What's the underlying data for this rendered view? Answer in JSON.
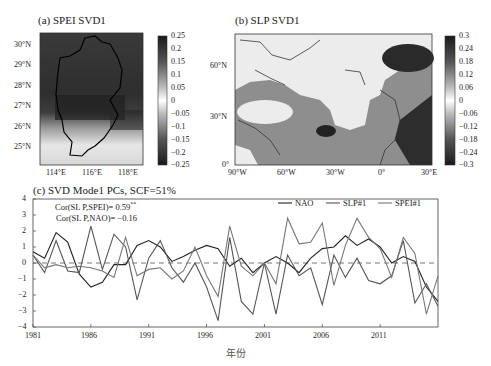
{
  "chart_data": [
    {
      "type": "heatmap",
      "title": "(a) SPEI SVD1",
      "xlabel": "",
      "ylabel": "",
      "x_ticks": [
        "114°E",
        "116°E",
        "118°E"
      ],
      "y_ticks": [
        "30°N",
        "29°N",
        "28°N",
        "27°N",
        "26°N",
        "25°N"
      ],
      "colorbar": {
        "ticks": [
          "0.25",
          "0.2",
          "0.15",
          "0.1",
          "0.05",
          "0",
          "−0.05",
          "−0.1",
          "−0.15",
          "−0.2",
          "−0.25"
        ],
        "range": [
          -0.25,
          0.25
        ],
        "colormap": "grayscale (dark = extreme, white = 0)"
      },
      "description": "Spatial pattern of leading SVD mode for SPEI over Jiangxi region; strong values (dark) across north/central, weak (light) in south"
    },
    {
      "type": "heatmap",
      "title": "(b) SLP SVD1",
      "xlabel": "",
      "ylabel": "",
      "x_ticks": [
        "90°W",
        "60°W",
        "30°W",
        "0°",
        "30°E"
      ],
      "y_ticks": [
        "60°N",
        "30°N",
        "0°"
      ],
      "colorbar": {
        "ticks": [
          "0.3",
          "0.24",
          "0.18",
          "0.12",
          "0.06",
          "0",
          "−0.06",
          "−0.12",
          "−0.18",
          "−0.24",
          "−0.3"
        ],
        "range": [
          -0.3,
          0.3
        ],
        "colormap": "grayscale (dark = extreme, white = 0)"
      },
      "description": "Spatial pattern of leading SVD mode for North Atlantic SLP; dark centers over Scandinavia/Europe-Africa and near 25°N 30°W"
    },
    {
      "type": "line",
      "title": "(c) SVD Mode1 PCs, SCF=51%",
      "xlabel": "年份",
      "ylabel": "",
      "ylim": [
        -4,
        4
      ],
      "xlim": [
        1981,
        2016
      ],
      "x_ticks": [
        "1981",
        "1986",
        "1991",
        "1996",
        "2001",
        "2006",
        "2011"
      ],
      "y_ticks": [
        "4",
        "3",
        "2",
        "1",
        "0",
        "−1",
        "−2",
        "−3",
        "−4"
      ],
      "grid": false,
      "zero_line": "dashed",
      "legend_position": "top-right",
      "annotations": [
        "Cor(SLP,SPEI)= 0.59**",
        "Cor(SLP,NAO)= −0.16"
      ],
      "x": [
        1981,
        1982,
        1983,
        1984,
        1985,
        1986,
        1987,
        1988,
        1989,
        1990,
        1991,
        1992,
        1993,
        1994,
        1995,
        1996,
        1997,
        1998,
        1999,
        2000,
        2001,
        2002,
        2003,
        2004,
        2005,
        2006,
        2007,
        2008,
        2009,
        2010,
        2011,
        2012,
        2013,
        2014,
        2015,
        2016
      ],
      "series": [
        {
          "name": "NAO",
          "color": "#222222",
          "values": [
            0.7,
            0.3,
            1.9,
            1.3,
            -0.7,
            -1.5,
            -1.2,
            -0.1,
            -0.1,
            1.1,
            1.4,
            1.0,
            0.1,
            0.4,
            0.8,
            1.1,
            0.9,
            -0.2,
            0.3,
            -0.6,
            0.0,
            0.4,
            0.0,
            -0.6,
            0.3,
            0.9,
            1.0,
            1.7,
            1.1,
            1.5,
            1.0,
            0.0,
            0.4,
            0.1,
            -1.5,
            -2.4
          ]
        },
        {
          "name": "SLP#1",
          "color": "#555555",
          "values": [
            0.5,
            -0.6,
            1.4,
            -0.5,
            -0.6,
            2.3,
            -0.4,
            1.8,
            1.0,
            -2.3,
            0.3,
            1.4,
            -0.3,
            -1.2,
            0.0,
            -1.5,
            -3.6,
            1.6,
            -2.4,
            -3.2,
            0.0,
            -3.2,
            0.5,
            -0.8,
            -0.3,
            -2.6,
            0.5,
            -0.9,
            0.3,
            -1.1,
            -1.3,
            -0.8,
            1.4,
            -2.5,
            -1.3,
            -2.7
          ]
        },
        {
          "name": "SPEI#1",
          "color": "#777777",
          "values": [
            0.5,
            -0.3,
            -0.1,
            -0.3,
            -0.2,
            -0.3,
            -0.5,
            -0.9,
            1.6,
            -0.8,
            -0.4,
            -0.3,
            -1.0,
            -0.5,
            1.0,
            -0.8,
            -2.1,
            2.3,
            -0.2,
            -0.8,
            0.0,
            -1.3,
            2.8,
            1.2,
            1.3,
            2.5,
            -1.4,
            1.1,
            2.8,
            1.6,
            0.9,
            -0.9,
            1.6,
            0.6,
            -3.2,
            -0.8
          ]
        }
      ]
    }
  ],
  "panel_a": {
    "title": "(a) SPEI SVD1",
    "x_ticks": [
      "114°E",
      "116°E",
      "118°E"
    ],
    "y_ticks": [
      "30°N",
      "29°N",
      "28°N",
      "27°N",
      "26°N",
      "25°N"
    ],
    "cb_ticks": [
      "0.25",
      "0.2",
      "0.15",
      "0.1",
      "0.05",
      "0",
      "−0.05",
      "−0.1",
      "−0.15",
      "−0.2",
      "−0.25"
    ]
  },
  "panel_b": {
    "title": "(b) SLP SVD1",
    "x_ticks": [
      "90°W",
      "60°W",
      "30°W",
      "0°",
      "30°E"
    ],
    "y_ticks": [
      "60°N",
      "30°N",
      "0°"
    ],
    "cb_ticks": [
      "0.3",
      "0.24",
      "0.18",
      "0.12",
      "0.06",
      "0",
      "−0.06",
      "−0.12",
      "−0.18",
      "−0.24",
      "−0.3"
    ]
  },
  "panel_c": {
    "title": "(c) SVD Mode1 PCs, SCF=51%",
    "xlabel": "年份",
    "cor1_prefix": "Cor(SL P,SPEI)= 0.59",
    "cor1_sup": "**",
    "cor2": "Cor(SL P,NAO)= −0.16",
    "legend": [
      "NAO",
      "SLP#1",
      "SPEI#1"
    ],
    "x_ticks": [
      "1981",
      "1986",
      "1991",
      "1996",
      "2001",
      "2006",
      "2011"
    ],
    "y_ticks": [
      "4",
      "3",
      "2",
      "1",
      "0",
      "−1",
      "−2",
      "−3",
      "−4"
    ]
  }
}
